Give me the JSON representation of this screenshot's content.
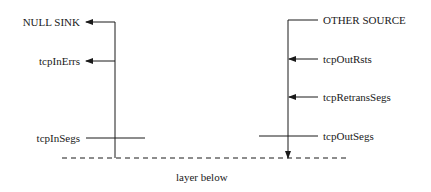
{
  "diagram": {
    "left_column": {
      "labels": [
        "NULL SINK",
        "tcpInErrs",
        "tcpInSegs"
      ]
    },
    "right_column": {
      "labels": [
        "OTHER SOURCE",
        "tcpOutRsts",
        "tcpRetransSegs",
        "tcpOutSegs"
      ]
    },
    "bottom_label": "layer below",
    "colors": {
      "line": "#1a1a1a",
      "background": "#ffffff"
    }
  }
}
